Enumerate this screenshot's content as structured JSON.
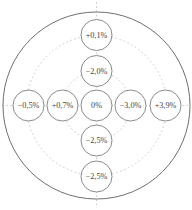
{
  "figure": {
    "kind": "concentric-target-diagram",
    "rings_visible": 2,
    "axes": [
      "vertical",
      "horizontal"
    ]
  },
  "nodes": [
    {
      "id": "top-outer",
      "label": "+0,1%"
    },
    {
      "id": "top-inner",
      "label": "−2,0%"
    },
    {
      "id": "left-outer",
      "label": "−0,5%"
    },
    {
      "id": "left-inner",
      "label": "+0,7%"
    },
    {
      "id": "center",
      "label": "0%"
    },
    {
      "id": "right-inner",
      "label": "−3,0%"
    },
    {
      "id": "right-outer",
      "label": "+3,9%"
    },
    {
      "id": "bottom-inner",
      "label": "−2,5%"
    },
    {
      "id": "bottom-outer",
      "label": "−2,5%"
    }
  ],
  "colors": {
    "background": "#ffffff",
    "boundary_stroke": "#6f6f6f",
    "node_stroke": "#7d7d7d",
    "guide_stroke": "#c2c2c2",
    "label_text": "#454545"
  }
}
